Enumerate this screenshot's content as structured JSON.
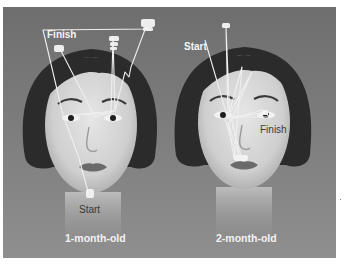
{
  "figure": {
    "colors": {
      "background": "#7a7a7a",
      "hair": "#2a2a2a",
      "skin": "#d8d8d8",
      "scanpath": "#f0f0f0"
    },
    "panels": [
      {
        "id": "one-month",
        "caption": "1-month-old",
        "start_label": "Start",
        "finish_label": "Finish",
        "start_label_style": "dark, below chin",
        "finish_label_style": "white bold, upper left"
      },
      {
        "id": "two-month",
        "caption": "2-month-old",
        "start_label": "Start",
        "finish_label": "Finish",
        "start_label_style": "white bold, upper left",
        "finish_label_style": "dark, beside right eye"
      }
    ]
  }
}
